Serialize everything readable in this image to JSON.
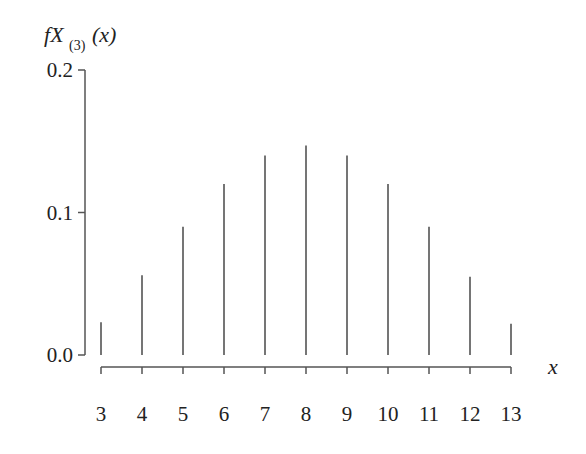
{
  "chart_data": {
    "type": "bar",
    "style": "stem",
    "title": "",
    "ylabel": "f_{X_{(3)}}(x)",
    "ylabel_parts": {
      "main": "f",
      "var": "X",
      "sub": "(3)",
      "arg": "(x)"
    },
    "xlabel": "x",
    "categories": [
      3,
      4,
      5,
      6,
      7,
      8,
      9,
      10,
      11,
      12,
      13
    ],
    "values": [
      0.023,
      0.056,
      0.09,
      0.12,
      0.14,
      0.147,
      0.14,
      0.12,
      0.09,
      0.055,
      0.022
    ],
    "ylim": [
      0.0,
      0.2
    ],
    "yticks": [
      "0.0",
      "0.1",
      "0.2"
    ],
    "xticks": [
      "3",
      "4",
      "5",
      "6",
      "7",
      "8",
      "9",
      "10",
      "11",
      "12",
      "13"
    ],
    "grid": false,
    "legend": null
  }
}
